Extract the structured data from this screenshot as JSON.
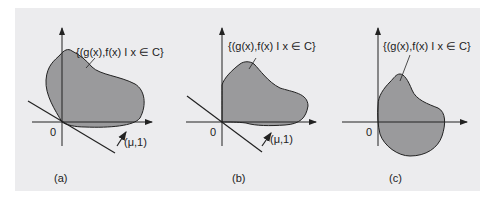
{
  "figure": {
    "panels": [
      {
        "id": "a",
        "caption": "(a)",
        "set_label": "{(g(x),f(x) I x ∈ C}",
        "origin_label": "0",
        "vector_label": "(μ,1)"
      },
      {
        "id": "b",
        "caption": "(b)",
        "set_label": "{(g(x),f(x) I x ∈ C}",
        "origin_label": "0",
        "vector_label": "(μ,1)"
      },
      {
        "id": "c",
        "caption": "(c)",
        "set_label": "{(g(x),f(x) I x ∈ C}",
        "origin_label": "0"
      }
    ],
    "colors": {
      "background": "#ececee",
      "region_fill": "#9a9a9c",
      "stroke": "#222222"
    }
  }
}
